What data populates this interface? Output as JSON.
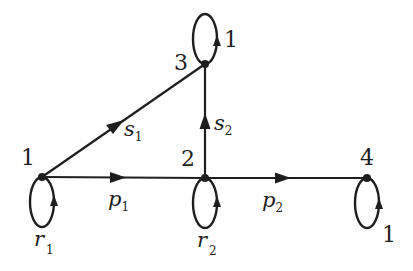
{
  "diagram": {
    "type": "directed-graph",
    "nodes": [
      {
        "id": "1",
        "label": "1"
      },
      {
        "id": "2",
        "label": "2"
      },
      {
        "id": "3",
        "label": "3"
      },
      {
        "id": "4",
        "label": "4"
      }
    ],
    "edges": [
      {
        "from": "1",
        "to": "2",
        "label": "p",
        "subscript": "1"
      },
      {
        "from": "2",
        "to": "4",
        "label": "p",
        "subscript": "2"
      },
      {
        "from": "1",
        "to": "3",
        "label": "s",
        "subscript": "1"
      },
      {
        "from": "2",
        "to": "3",
        "label": "s",
        "subscript": "2"
      }
    ],
    "self_loops": [
      {
        "node": "1",
        "label": "r",
        "subscript": "1"
      },
      {
        "node": "2",
        "label": "r",
        "subscript": "2"
      },
      {
        "node": "3",
        "label": "1"
      },
      {
        "node": "4",
        "label": "1"
      }
    ]
  }
}
